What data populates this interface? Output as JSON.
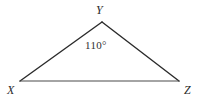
{
  "figure": {
    "type": "geometry-diagram",
    "shape": "triangle",
    "name": "triangle-XYZ",
    "background_color": "#ffffff",
    "stroke_color": "#2b2b2b",
    "baseline_stroke_color": "#4a4a4a",
    "label_color": "#2b2b2b",
    "vertices": [
      {
        "id": "Y",
        "label": "Y",
        "x": 102,
        "y": 22,
        "label_x": 96,
        "label_y": 4,
        "position": "apex-top"
      },
      {
        "id": "X",
        "label": "X",
        "x": 20,
        "y": 81,
        "label_x": 7,
        "label_y": 84,
        "position": "bottom-left"
      },
      {
        "id": "Z",
        "label": "Z",
        "x": 179,
        "y": 81,
        "label_x": 184,
        "label_y": 84,
        "position": "bottom-right"
      }
    ],
    "edges": [
      {
        "id": "XY",
        "from": "X",
        "to": "Y"
      },
      {
        "id": "YZ",
        "from": "Y",
        "to": "Z"
      },
      {
        "id": "XZ",
        "from": "X",
        "to": "Z"
      }
    ],
    "angles": [
      {
        "id": "angle-at-Y",
        "at_vertex": "Y",
        "value": 110,
        "unit": "degrees",
        "label": "110°",
        "label_x": 85,
        "label_y": 39
      }
    ]
  }
}
